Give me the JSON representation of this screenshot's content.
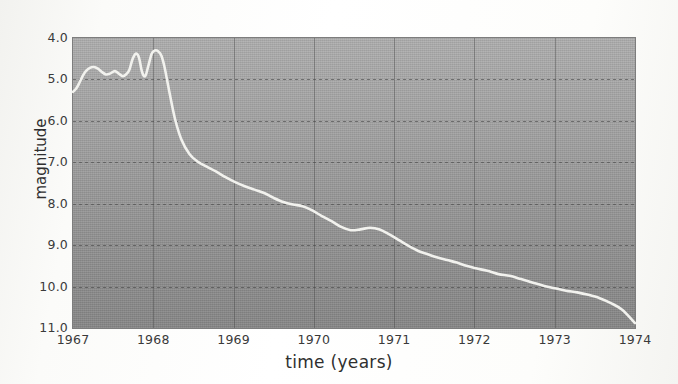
{
  "chart_data": {
    "type": "line",
    "title": "",
    "subtitle": "",
    "xlabel": "time (years)",
    "ylabel": "magnitude",
    "xlim": [
      1967,
      1974
    ],
    "ylim": [
      4.0,
      11.0
    ],
    "y_inverted": true,
    "grid": true,
    "legend": "none",
    "xticks": [
      "1967",
      "1968",
      "1969",
      "1970",
      "1971",
      "1972",
      "1973",
      "1974"
    ],
    "yticks": [
      "4.0",
      "5.0",
      "6.0",
      "7.0",
      "8.0",
      "9.0",
      "10.0",
      "11.0"
    ],
    "series": [
      {
        "name": "magnitude",
        "color": "#f2f2ee",
        "x": [
          1967.0,
          1967.04,
          1967.08,
          1967.12,
          1967.16,
          1967.21,
          1967.26,
          1967.31,
          1967.36,
          1967.41,
          1967.46,
          1967.52,
          1967.57,
          1967.62,
          1967.66,
          1967.7,
          1967.74,
          1967.78,
          1967.82,
          1967.86,
          1967.9,
          1967.94,
          1967.98,
          1968.02,
          1968.06,
          1968.1,
          1968.14,
          1968.2,
          1968.27,
          1968.35,
          1968.45,
          1968.55,
          1968.66,
          1968.78,
          1968.9,
          1969.02,
          1969.14,
          1969.26,
          1969.38,
          1969.5,
          1969.62,
          1969.74,
          1969.86,
          1969.98,
          1970.1,
          1970.22,
          1970.34,
          1970.46,
          1970.58,
          1970.7,
          1970.82,
          1970.94,
          1971.06,
          1971.18,
          1971.3,
          1971.42,
          1971.54,
          1971.66,
          1971.78,
          1971.9,
          1972.02,
          1972.16,
          1972.3,
          1972.44,
          1972.58,
          1972.72,
          1972.86,
          1973.0,
          1973.14,
          1973.28,
          1973.42,
          1973.56,
          1973.7,
          1973.84,
          1974.0
        ],
        "y": [
          5.3,
          5.22,
          5.08,
          4.92,
          4.8,
          4.72,
          4.7,
          4.74,
          4.82,
          4.88,
          4.86,
          4.8,
          4.86,
          4.92,
          4.88,
          4.78,
          4.52,
          4.38,
          4.46,
          4.82,
          4.92,
          4.66,
          4.38,
          4.3,
          4.32,
          4.42,
          4.7,
          5.3,
          5.95,
          6.45,
          6.8,
          6.98,
          7.1,
          7.22,
          7.36,
          7.48,
          7.58,
          7.66,
          7.74,
          7.86,
          7.96,
          8.02,
          8.06,
          8.16,
          8.3,
          8.42,
          8.56,
          8.64,
          8.62,
          8.58,
          8.62,
          8.74,
          8.88,
          9.02,
          9.14,
          9.22,
          9.3,
          9.36,
          9.42,
          9.5,
          9.56,
          9.62,
          9.7,
          9.74,
          9.82,
          9.9,
          9.98,
          10.04,
          10.1,
          10.14,
          10.2,
          10.28,
          10.4,
          10.56,
          10.88
        ]
      }
    ]
  },
  "axes": {
    "ylabel": "magnitude",
    "xlabel": "time (years)",
    "yticks": [
      {
        "label": "4.0",
        "value": 4.0
      },
      {
        "label": "5.0",
        "value": 5.0
      },
      {
        "label": "6.0",
        "value": 6.0
      },
      {
        "label": "7.0",
        "value": 7.0
      },
      {
        "label": "8.0",
        "value": 8.0
      },
      {
        "label": "9.0",
        "value": 9.0
      },
      {
        "label": "10.0",
        "value": 10.0
      },
      {
        "label": "11.0",
        "value": 11.0
      }
    ],
    "xticks": [
      {
        "label": "1967",
        "value": 1967
      },
      {
        "label": "1968",
        "value": 1968
      },
      {
        "label": "1969",
        "value": 1969
      },
      {
        "label": "1970",
        "value": 1970
      },
      {
        "label": "1971",
        "value": 1971
      },
      {
        "label": "1972",
        "value": 1972
      },
      {
        "label": "1973",
        "value": 1973
      },
      {
        "label": "1974",
        "value": 1974
      }
    ]
  },
  "colors": {
    "plot_background_top": "#adadad",
    "plot_background_bottom": "#868686",
    "curve": "#f2f2ee",
    "gridline": "#4a4a4a",
    "text": "#3a3a3a",
    "page_background": "#fdfdfc"
  }
}
